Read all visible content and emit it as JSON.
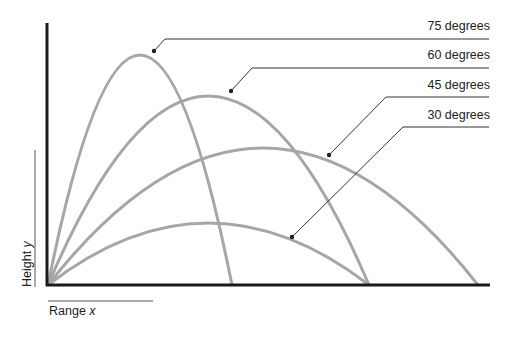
{
  "diagram": {
    "axes": {
      "x_label": "Range",
      "x_var": "x",
      "y_label": "Height",
      "y_var": "y"
    },
    "curves": [
      {
        "label": "75 degrees",
        "angle": 75,
        "peak": [
          139,
          55
        ],
        "land_x": 232
      },
      {
        "label": "60 degrees",
        "angle": 60,
        "peak": [
          207,
          96
        ],
        "land_x": 369
      },
      {
        "label": "45 degrees",
        "angle": 45,
        "peak": [
          262,
          148
        ],
        "land_x": 478
      },
      {
        "label": "30 degrees",
        "angle": 30,
        "peak": [
          209,
          223
        ],
        "land_x": 369
      }
    ],
    "colors": {
      "curve": "#a6a6a6",
      "axis": "#1a1a1a",
      "leader": "#333333"
    }
  }
}
